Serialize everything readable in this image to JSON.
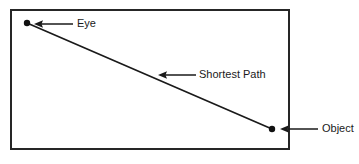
{
  "diagram": {
    "type": "line-diagram",
    "canvas": {
      "width": 359,
      "height": 164,
      "background": "#ffffff"
    },
    "frame": {
      "name": "bounding-rectangle",
      "x": 10,
      "y": 9,
      "width": 280,
      "height": 141,
      "stroke": "#262626",
      "stroke_width": 2,
      "fill": "#ffffff"
    },
    "colors": {
      "stroke": "#1a1a1a",
      "frame_stroke": "#262626",
      "text": "#1a1a1a",
      "background": "#ffffff"
    },
    "points": [
      {
        "name": "eye-point",
        "label": "Eye",
        "x": 27,
        "y": 23,
        "radius": 3.2
      },
      {
        "name": "object-point",
        "label": "Object",
        "x": 272,
        "y": 129,
        "radius": 3.2
      }
    ],
    "path": {
      "name": "shortest-path-line",
      "label": "Shortest Path",
      "x1": 27,
      "y1": 23,
      "x2": 272,
      "y2": 129,
      "stroke_width": 1.7
    },
    "annotations": [
      {
        "name": "eye-annotation",
        "label": "Eye",
        "arrow": {
          "tail_x": 73,
          "tail_y": 24,
          "head_x": 34,
          "head_y": 24
        },
        "text_x": 77,
        "text_y": 24
      },
      {
        "name": "shortest-path-annotation",
        "label": "Shortest Path",
        "arrow": {
          "tail_x": 196,
          "tail_y": 75,
          "head_x": 158,
          "head_y": 75
        },
        "text_x": 199,
        "text_y": 75
      },
      {
        "name": "object-annotation",
        "label": "Object",
        "arrow": {
          "tail_x": 318,
          "tail_y": 129,
          "head_x": 280,
          "head_y": 129
        },
        "text_x": 322,
        "text_y": 129
      }
    ]
  }
}
